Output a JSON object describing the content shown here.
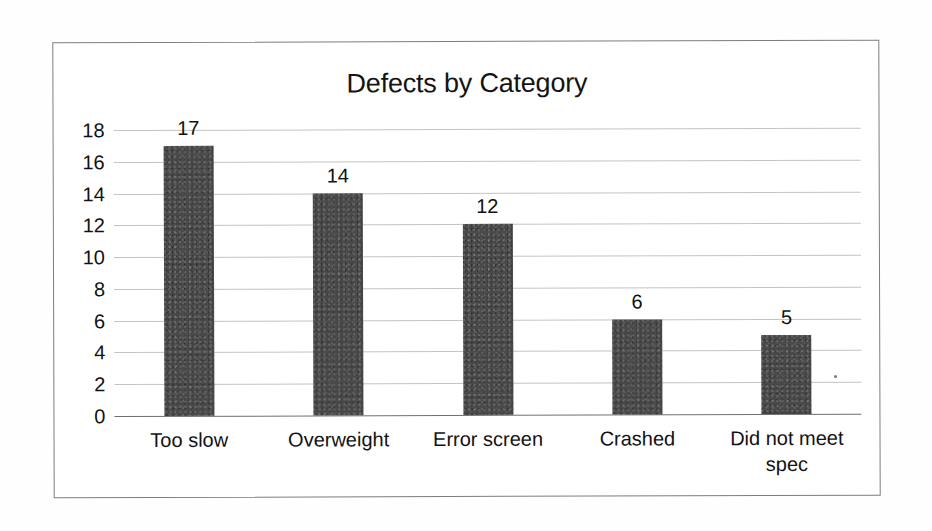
{
  "document": {
    "kind": "scanned-bar-chart",
    "background_color": "#ffffff",
    "frame_color": "#7d7d7d"
  },
  "chart_data": {
    "type": "bar",
    "title": "Defects by Category",
    "xlabel": "",
    "ylabel": "",
    "categories": [
      "Too slow",
      "Overweight",
      "Error screen",
      "Crashed",
      "Did not meet spec"
    ],
    "values": [
      17,
      14,
      12,
      6,
      5
    ],
    "value_labels": [
      "17",
      "14",
      "12",
      "6",
      "5"
    ],
    "ylim": [
      0,
      18
    ],
    "ytick_step": 2,
    "yticks": [
      18,
      16,
      14,
      12,
      10,
      8,
      6,
      4,
      2,
      0
    ],
    "ytick_labels": [
      "18",
      "16",
      "14",
      "12",
      "10",
      "8",
      "6",
      "4",
      "2",
      "0"
    ],
    "grid": true,
    "grid_axis": "y",
    "legend": false,
    "legend_position": "none",
    "bar_color": "#4a4a4a",
    "gridline_color": "#b9b9b9",
    "axis_color": "#6f6f6f",
    "data_labels_shown": true,
    "series": [
      {
        "name": "Defects",
        "values": [
          17,
          14,
          12,
          6,
          5
        ]
      }
    ]
  }
}
